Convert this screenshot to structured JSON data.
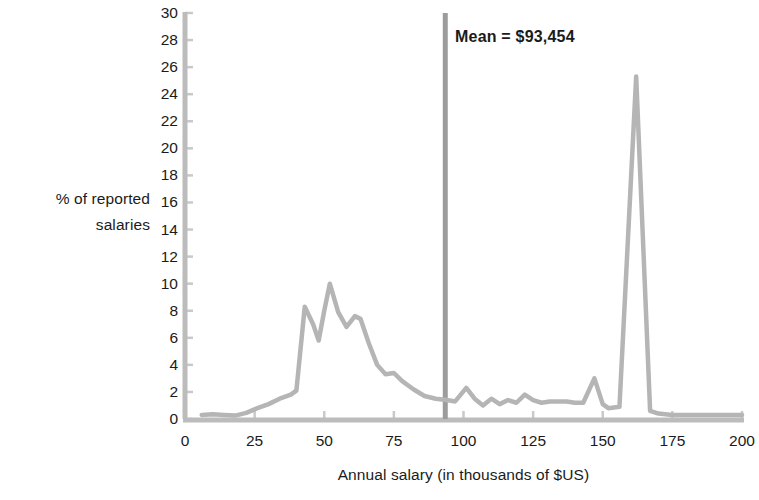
{
  "chart_data": {
    "type": "line",
    "title": "",
    "xlabel": "Annual salary (in thousands of $US)",
    "ylabel_line1": "% of reported",
    "ylabel_line2": "salaries",
    "xlim": [
      0,
      200
    ],
    "ylim": [
      0,
      30
    ],
    "xticks": [
      0,
      25,
      50,
      75,
      100,
      125,
      150,
      175,
      200
    ],
    "yticks": [
      0,
      2,
      4,
      6,
      8,
      10,
      12,
      14,
      16,
      18,
      20,
      22,
      24,
      26,
      28,
      30
    ],
    "grid": false,
    "legend": "none",
    "line_color": "#b5b5b5",
    "axis_color": "#b9b9b9",
    "annotations": [
      {
        "name": "mean-line",
        "label": "Mean = $93,454",
        "value": 93.454,
        "orientation": "vertical",
        "color": "#9c9c9c"
      }
    ],
    "series": [
      {
        "name": "% of reported salaries",
        "x": [
          6,
          10,
          14,
          18,
          22,
          26,
          30,
          34,
          38,
          40,
          43,
          46,
          48,
          50,
          52,
          55,
          58,
          61,
          63,
          66,
          69,
          72,
          75,
          78,
          82,
          86,
          90,
          94,
          97,
          101,
          104,
          107,
          110,
          113,
          116,
          119,
          122,
          125,
          128,
          131,
          134,
          137,
          140,
          143,
          147,
          150,
          152,
          156,
          162,
          167,
          170,
          175,
          180,
          185,
          190,
          195,
          200
        ],
        "y": [
          0.3,
          0.35,
          0.3,
          0.25,
          0.45,
          0.8,
          1.1,
          1.5,
          1.8,
          2.1,
          8.3,
          7.0,
          5.8,
          8.0,
          10.0,
          7.9,
          6.8,
          7.6,
          7.4,
          5.6,
          4.0,
          3.3,
          3.4,
          2.8,
          2.2,
          1.7,
          1.5,
          1.4,
          1.3,
          2.3,
          1.5,
          1.0,
          1.5,
          1.1,
          1.4,
          1.2,
          1.8,
          1.4,
          1.2,
          1.3,
          1.3,
          1.3,
          1.2,
          1.2,
          3.0,
          1.1,
          0.8,
          0.9,
          25.3,
          0.6,
          0.4,
          0.3,
          0.3,
          0.3,
          0.3,
          0.3,
          0.3
        ]
      }
    ]
  }
}
